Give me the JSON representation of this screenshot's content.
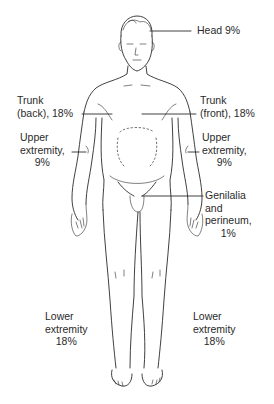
{
  "regions": {
    "head": {
      "lines": [
        "Head 9%"
      ],
      "name": "Head",
      "percent": 9
    },
    "trunk_back": {
      "lines": [
        "Trunk",
        "(back), 18%"
      ],
      "name": "Trunk (back)",
      "percent": 18
    },
    "trunk_front": {
      "lines": [
        "Trunk",
        "(front), 18%"
      ],
      "name": "Trunk (front)",
      "percent": 18
    },
    "upper_left": {
      "lines": [
        "Upper",
        "extremity,",
        "9%"
      ],
      "name": "Upper extremity",
      "percent": 9
    },
    "upper_right": {
      "lines": [
        "Upper",
        "extremity,",
        "9%"
      ],
      "name": "Upper extremity",
      "percent": 9
    },
    "genitalia": {
      "lines": [
        "Genilalia",
        "and",
        "perineum,",
        "1%"
      ],
      "name": "Genitalia and perineum",
      "percent": 1
    },
    "lower_left": {
      "lines": [
        "Lower",
        "extremity",
        "18%"
      ],
      "name": "Lower extremity",
      "percent": 18
    },
    "lower_right": {
      "lines": [
        "Lower",
        "extremity",
        "18%"
      ],
      "name": "Lower extremity",
      "percent": 18
    }
  }
}
